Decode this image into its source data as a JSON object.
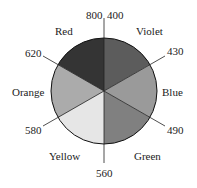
{
  "diagram": {
    "type": "color-wheel",
    "center": [
      104,
      91
    ],
    "radius": 53,
    "sectors": [
      {
        "name": "Violet",
        "from": 400,
        "to": 430,
        "fill": "#5c5c5c"
      },
      {
        "name": "Blue",
        "from": 430,
        "to": 490,
        "fill": "#9a9a9a"
      },
      {
        "name": "Green",
        "from": 490,
        "to": 560,
        "fill": "#808080"
      },
      {
        "name": "Yellow",
        "from": 560,
        "to": 580,
        "fill": "#e6e6e6"
      },
      {
        "name": "Orange",
        "from": 580,
        "to": 620,
        "fill": "#ababab"
      },
      {
        "name": "Red",
        "from": 620,
        "to": 800,
        "fill": "#343434"
      }
    ],
    "boundary_labels": {
      "top_left": "800",
      "top_right": "400",
      "b430": "430",
      "b490": "490",
      "b560": "560",
      "b580": "580",
      "b620": "620"
    },
    "sector_labels": {
      "violet": "Violet",
      "blue": "Blue",
      "green": "Green",
      "yellow": "Yellow",
      "orange": "Orange",
      "red": "Red"
    }
  }
}
